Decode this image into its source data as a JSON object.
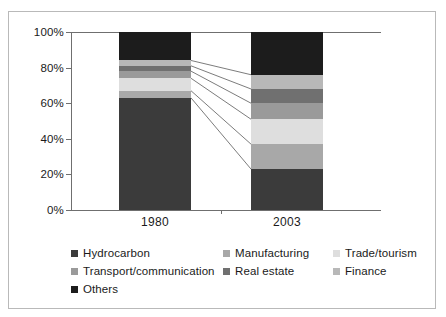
{
  "chart_data": {
    "type": "bar",
    "stacked": true,
    "normalized_percent": true,
    "title": "",
    "xlabel": "",
    "ylabel": "",
    "categories": [
      "1980",
      "2003"
    ],
    "ylim": [
      0,
      100
    ],
    "y_ticks": [
      "0%",
      "20%",
      "40%",
      "60%",
      "80%",
      "100%"
    ],
    "y_tick_values": [
      0,
      20,
      40,
      60,
      80,
      100
    ],
    "grid": false,
    "legend_position": "bottom",
    "series": [
      {
        "name": "Hydrocarbon",
        "color": "#3b3b3b",
        "values": [
          63,
          23
        ]
      },
      {
        "name": "Manufacturing",
        "color": "#a8a8a8",
        "values": [
          4,
          14
        ]
      },
      {
        "name": "Trade/tourism",
        "color": "#dedede",
        "values": [
          7,
          14
        ]
      },
      {
        "name": "Transport/communication",
        "color": "#9a9a9a",
        "values": [
          4,
          9
        ]
      },
      {
        "name": "Real estate",
        "color": "#707070",
        "values": [
          3,
          8
        ]
      },
      {
        "name": "Finance",
        "color": "#b8b8b8",
        "values": [
          3,
          8
        ]
      },
      {
        "name": "Others",
        "color": "#1c1c1c",
        "values": [
          16,
          24
        ]
      }
    ],
    "connector_lines": true
  },
  "legend": {
    "rows": [
      [
        {
          "label": "Hydrocarbon",
          "color": "#3b3b3b"
        },
        {
          "label": "Manufacturing",
          "color": "#a8a8a8"
        },
        {
          "label": "Trade/tourism",
          "color": "#dedede"
        }
      ],
      [
        {
          "label": "Transport/communication",
          "color": "#9a9a9a"
        },
        {
          "label": "Real estate",
          "color": "#707070"
        },
        {
          "label": "Finance",
          "color": "#b8b8b8"
        }
      ],
      [
        {
          "label": "Others",
          "color": "#1c1c1c"
        }
      ]
    ]
  },
  "axis": {
    "y_labels": [
      "100%",
      "80%",
      "60%",
      "40%",
      "20%",
      "0%"
    ],
    "x_labels": [
      "1980",
      "2003"
    ]
  }
}
